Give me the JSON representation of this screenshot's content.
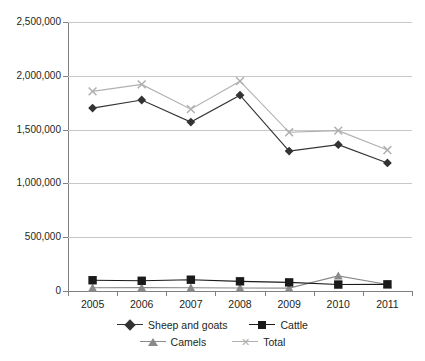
{
  "chart": {
    "title": "",
    "y_axis": {
      "labels": [
        "2,500,000",
        "2,000,000",
        "1,500,000",
        "1,000,000",
        "500,000",
        "0"
      ]
    },
    "x_axis": {
      "labels": [
        "2005",
        "2006",
        "2007",
        "2008",
        "2009",
        "2010",
        "2011"
      ]
    },
    "legend": {
      "items": [
        {
          "label": "Sheep and goats",
          "marker": "diamond-marker",
          "color": "#333333"
        },
        {
          "label": "Cattle",
          "marker": "square-marker",
          "color": "#1a1a1a"
        },
        {
          "label": "Camels",
          "marker": "triangle-marker",
          "color": "#8a8a8a"
        },
        {
          "label": "Total",
          "marker": "x-marker",
          "color": "#b0b0b0"
        }
      ]
    }
  },
  "chart_data": {
    "type": "line",
    "title": "",
    "xlabel": "",
    "ylabel": "",
    "categories": [
      "2005",
      "2006",
      "2007",
      "2008",
      "2009",
      "2010",
      "2011"
    ],
    "ylim": [
      0,
      2500000
    ],
    "yticks": [
      0,
      500000,
      1000000,
      1500000,
      2000000,
      2500000
    ],
    "grid": true,
    "legend_position": "bottom",
    "series": [
      {
        "name": "Sheep and goats",
        "color": "#333333",
        "marker": "diamond",
        "values": [
          1700000,
          1775000,
          1570000,
          1820000,
          1300000,
          1360000,
          1190000
        ]
      },
      {
        "name": "Cattle",
        "color": "#1a1a1a",
        "marker": "square",
        "values": [
          100000,
          95000,
          105000,
          90000,
          80000,
          60000,
          62000
        ]
      },
      {
        "name": "Camels",
        "color": "#8a8a8a",
        "marker": "triangle",
        "values": [
          30000,
          32000,
          30000,
          28000,
          27000,
          140000,
          60000
        ]
      },
      {
        "name": "Total",
        "color": "#b0b0b0",
        "marker": "x",
        "values": [
          1855000,
          1920000,
          1690000,
          1950000,
          1475000,
          1490000,
          1310000
        ]
      }
    ]
  }
}
